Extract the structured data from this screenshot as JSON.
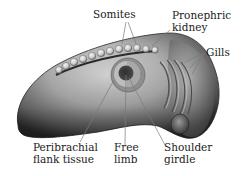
{
  "diagram": {
    "labels": {
      "somites": "Somites",
      "pronephric_kidney": [
        "Pronephric",
        "kidney"
      ],
      "gills": "Gills",
      "peribrachial_flank_tissue": [
        "Peribrachial",
        "flank tissue"
      ],
      "free_limb": [
        "Free",
        "limb"
      ],
      "shoulder_girdle": [
        "Shoulder",
        "girdle"
      ]
    },
    "colors": {
      "background": "#ffffff",
      "body_light": "#d8d8d8",
      "body_mid": "#9a9a9a",
      "body_dark": "#3a3a3a",
      "somite": "#d6d6d6",
      "limb_outer": "#8c8c8c",
      "limb_ring": "#b9b9b9",
      "limb_center": "#3d3d3d",
      "leader_line": "#7a7a7a",
      "text": "#1a1a1a"
    }
  }
}
